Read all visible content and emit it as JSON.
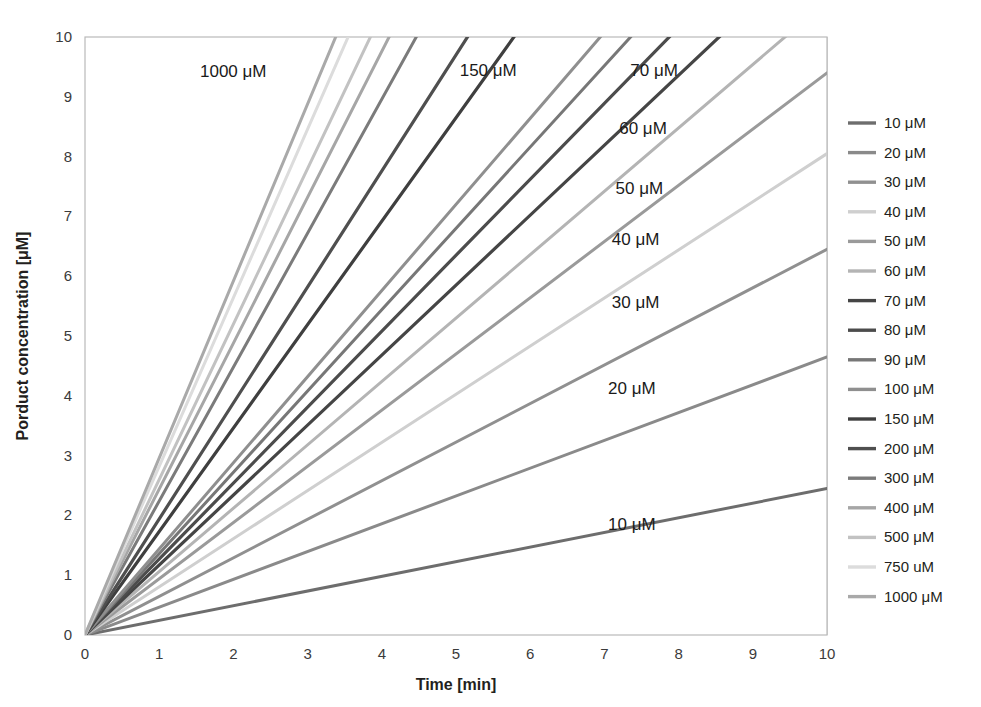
{
  "chart_data": {
    "type": "line",
    "title": "",
    "xlabel": "Time [min]",
    "ylabel": "Porduct concentration [μM]",
    "xlim": [
      0,
      10
    ],
    "ylim": [
      0,
      10
    ],
    "xticks": [
      "0",
      "1",
      "2",
      "3",
      "4",
      "5",
      "6",
      "7",
      "8",
      "9",
      "10"
    ],
    "yticks": [
      "0",
      "1",
      "2",
      "3",
      "4",
      "5",
      "6",
      "7",
      "8",
      "9",
      "10"
    ],
    "grid": true,
    "legend_position": "right",
    "x": [
      0,
      10
    ],
    "series": [
      {
        "name": "10 μM",
        "label": "10 μM",
        "slope": 0.245,
        "values": [
          0,
          2.45
        ],
        "color": "#6d6d6d",
        "width": 3.0,
        "annotated": true,
        "annotation": "10 μM",
        "annotation_x": 7.05,
        "annotation_y": 1.83
      },
      {
        "name": "20 μM",
        "label": "20 μM",
        "slope": 0.465,
        "values": [
          0,
          4.65
        ],
        "color": "#8a8a8a",
        "width": 3.0,
        "annotated": true,
        "annotation": "20 μM",
        "annotation_x": 7.05,
        "annotation_y": 4.1
      },
      {
        "name": "30 μM",
        "label": "30 μM",
        "slope": 0.645,
        "values": [
          0,
          6.45
        ],
        "color": "#909090",
        "width": 3.0,
        "annotated": true,
        "annotation": "30 μM",
        "annotation_x": 7.1,
        "annotation_y": 5.55
      },
      {
        "name": "40 μM",
        "label": "40 μM",
        "slope": 0.805,
        "values": [
          0,
          8.05
        ],
        "color": "#cfcfcf",
        "width": 3.0,
        "annotated": true,
        "annotation": "40 μM",
        "annotation_x": 7.1,
        "annotation_y": 6.6
      },
      {
        "name": "50 μM",
        "label": "50 μM",
        "slope": 0.94,
        "values": [
          0,
          9.4
        ],
        "color": "#9a9a9a",
        "width": 3.0,
        "annotated": true,
        "annotation": "50 μM",
        "annotation_x": 7.15,
        "annotation_y": 7.45
      },
      {
        "name": "60 μM",
        "label": "60 μM",
        "slope": 1.06,
        "values": [
          0,
          10.6
        ],
        "color": "#b4b4b4",
        "width": 3.0,
        "annotated": true,
        "annotation": "60 μM",
        "annotation_x": 7.2,
        "annotation_y": 8.45
      },
      {
        "name": "70 μM",
        "label": "70 μM",
        "slope": 1.17,
        "values": [
          0,
          11.7
        ],
        "color": "#454545",
        "width": 3.2,
        "annotated": true,
        "annotation": "70 μM",
        "annotation_x": 7.35,
        "annotation_y": 9.42
      },
      {
        "name": "80 μM",
        "label": "80 μM",
        "slope": 1.27,
        "values": [
          0,
          12.7
        ],
        "color": "#4c4c4c",
        "width": 3.2,
        "annotated": false,
        "annotation": "",
        "annotation_x": 0,
        "annotation_y": 0
      },
      {
        "name": "90 μM",
        "label": "90 μM",
        "slope": 1.36,
        "values": [
          0,
          13.6
        ],
        "color": "#777777",
        "width": 3.0,
        "annotated": false,
        "annotation": "",
        "annotation_x": 0,
        "annotation_y": 0
      },
      {
        "name": "100 μM",
        "label": "100 μM",
        "slope": 1.44,
        "values": [
          0,
          14.4
        ],
        "color": "#8f8f8f",
        "width": 3.0,
        "annotated": false,
        "annotation": "",
        "annotation_x": 0,
        "annotation_y": 0
      },
      {
        "name": "150 μM",
        "label": "150 μM",
        "slope": 1.73,
        "values": [
          0,
          17.3
        ],
        "color": "#3f3f3f",
        "width": 3.2,
        "annotated": true,
        "annotation": "150 μM",
        "annotation_x": 5.05,
        "annotation_y": 9.42
      },
      {
        "name": "200 μM",
        "label": "200 μM",
        "slope": 1.94,
        "values": [
          0,
          19.4
        ],
        "color": "#4f4f4f",
        "width": 3.2,
        "annotated": false,
        "annotation": "",
        "annotation_x": 0,
        "annotation_y": 0
      },
      {
        "name": "300 μM",
        "label": "300 μM",
        "slope": 2.24,
        "values": [
          0,
          22.4
        ],
        "color": "#7b7b7b",
        "width": 3.0,
        "annotated": false,
        "annotation": "",
        "annotation_x": 0,
        "annotation_y": 0
      },
      {
        "name": "400 μM",
        "label": "400 μM",
        "slope": 2.44,
        "values": [
          0,
          24.4
        ],
        "color": "#a6a6a6",
        "width": 3.0,
        "annotated": false,
        "annotation": "",
        "annotation_x": 0,
        "annotation_y": 0
      },
      {
        "name": "500 μM",
        "label": "500 μM",
        "slope": 2.6,
        "values": [
          0,
          26.0
        ],
        "color": "#c2c2c2",
        "width": 3.0,
        "annotated": false,
        "annotation": "",
        "annotation_x": 0,
        "annotation_y": 0
      },
      {
        "name": "750 uM",
        "label": "750 uM",
        "slope": 2.82,
        "values": [
          0,
          28.2
        ],
        "color": "#dcdcdc",
        "width": 3.0,
        "annotated": false,
        "annotation": "",
        "annotation_x": 0,
        "annotation_y": 0
      },
      {
        "name": "1000 μM",
        "label": "1000 μM",
        "slope": 2.96,
        "values": [
          0,
          29.6
        ],
        "color": "#a9a9a9",
        "width": 3.0,
        "annotated": true,
        "annotation": "1000 μM",
        "annotation_x": 1.55,
        "annotation_y": 9.4
      }
    ]
  },
  "legend": {
    "title": "",
    "items": [
      {
        "label": "10 μM",
        "color": "#6d6d6d"
      },
      {
        "label": "20 μM",
        "color": "#8a8a8a"
      },
      {
        "label": "30 μM",
        "color": "#909090"
      },
      {
        "label": "40 μM",
        "color": "#cfcfcf"
      },
      {
        "label": "50 μM",
        "color": "#9a9a9a"
      },
      {
        "label": "60 μM",
        "color": "#b4b4b4"
      },
      {
        "label": "70 μM",
        "color": "#454545"
      },
      {
        "label": "80 μM",
        "color": "#4c4c4c"
      },
      {
        "label": "90 μM",
        "color": "#777777"
      },
      {
        "label": "100 μM",
        "color": "#8f8f8f"
      },
      {
        "label": "150 μM",
        "color": "#3f3f3f"
      },
      {
        "label": "200 μM",
        "color": "#4f4f4f"
      },
      {
        "label": "300 μM",
        "color": "#7b7b7b"
      },
      {
        "label": "400 μM",
        "color": "#a6a6a6"
      },
      {
        "label": "500 μM",
        "color": "#c2c2c2"
      },
      {
        "label": "750 uM",
        "color": "#dcdcdc"
      },
      {
        "label": "1000 μM",
        "color": "#a9a9a9"
      }
    ]
  },
  "style": {
    "background": "#ffffff",
    "grid_color": "#d8d8d8",
    "frame_color": "#b9b9b9",
    "text_color": "#231f20"
  },
  "geometry": {
    "plot_left": 85,
    "plot_right": 827,
    "plot_top": 37,
    "plot_bottom": 635,
    "legend_x_swatch": 848,
    "legend_x_label": 884,
    "legend_y_start": 123,
    "legend_row_height": 29.6
  }
}
